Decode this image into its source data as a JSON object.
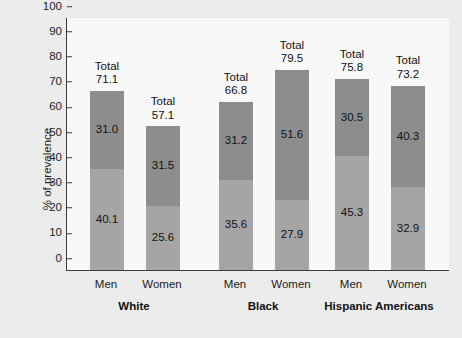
{
  "chart_data": {
    "type": "bar",
    "subtype": "stacked",
    "title": "",
    "xlabel": "",
    "ylabel": "% of prevalence",
    "ylim": [
      0,
      100
    ],
    "yticks": [
      0,
      10,
      20,
      30,
      40,
      50,
      60,
      70,
      80,
      90,
      100
    ],
    "grid": false,
    "legend": "none",
    "groups": [
      "White",
      "Black",
      "Hispanic Americans"
    ],
    "categories": [
      "Men",
      "Women",
      "Men",
      "Women",
      "Men",
      "Women"
    ],
    "series": [
      {
        "name": "lower-segment",
        "color": "#a5a5a5",
        "values": [
          40.1,
          25.6,
          35.6,
          27.9,
          45.3,
          32.9
        ]
      },
      {
        "name": "upper-segment",
        "color": "#8d8d8d",
        "values": [
          31.0,
          31.5,
          31.2,
          51.6,
          30.5,
          40.3
        ]
      }
    ],
    "totals": [
      71.1,
      57.1,
      66.8,
      79.5,
      75.8,
      73.2
    ],
    "total_prefix": "Total"
  },
  "axis": {
    "y_title": "% of prevalence",
    "y_ticks": [
      "100",
      "90",
      "80",
      "70",
      "60",
      "50",
      "40",
      "30",
      "20",
      "10",
      "0"
    ]
  },
  "bars": [
    {
      "id": "white-men",
      "sex": "Men",
      "group": "White",
      "lower": "40.1",
      "upper": "31.0",
      "total_word": "Total",
      "total": "71.1",
      "lower_value": 40.1,
      "upper_value": 31.0,
      "total_value": 71.1,
      "x": 89,
      "width": 34
    },
    {
      "id": "white-women",
      "sex": "Women",
      "group": "White",
      "lower": "25.6",
      "upper": "31.5",
      "total_word": "Total",
      "total": "57.1",
      "lower_value": 25.6,
      "upper_value": 31.5,
      "total_value": 57.1,
      "x": 145,
      "width": 34
    },
    {
      "id": "black-men",
      "sex": "Men",
      "group": "Black",
      "lower": "35.6",
      "upper": "31.2",
      "total_word": "Total",
      "total": "66.8",
      "lower_value": 35.6,
      "upper_value": 31.2,
      "total_value": 66.8,
      "x": 218,
      "width": 34
    },
    {
      "id": "black-women",
      "sex": "Women",
      "group": "Black",
      "lower": "27.9",
      "upper": "51.6",
      "total_word": "Total",
      "total": "79.5",
      "lower_value": 27.9,
      "upper_value": 51.6,
      "total_value": 79.5,
      "x": 274,
      "width": 34
    },
    {
      "id": "hispanic-men",
      "sex": "Men",
      "group": "Hispanic Americans",
      "lower": "45.3",
      "upper": "30.5",
      "total_word": "Total",
      "total": "75.8",
      "lower_value": 45.3,
      "upper_value": 30.5,
      "total_value": 75.8,
      "x": 334,
      "width": 34
    },
    {
      "id": "hispanic-women",
      "sex": "Women",
      "group": "Hispanic Americans",
      "lower": "32.9",
      "upper": "40.3",
      "total_word": "Total",
      "total": "73.2",
      "lower_value": 32.9,
      "upper_value": 40.3,
      "total_value": 73.2,
      "x": 390,
      "width": 34
    }
  ],
  "groups": [
    {
      "label": "White",
      "center": 134
    },
    {
      "label": "Black",
      "center": 263
    },
    {
      "label": "Hispanic Americans",
      "center": 379
    }
  ],
  "colors": {
    "lower_segment": "#a5a5a5",
    "upper_segment": "#8d8d8d",
    "plot_background": "#f8f8f8",
    "page_background": "#ececec",
    "axis": "#3a3a3a",
    "text": "#111111"
  }
}
